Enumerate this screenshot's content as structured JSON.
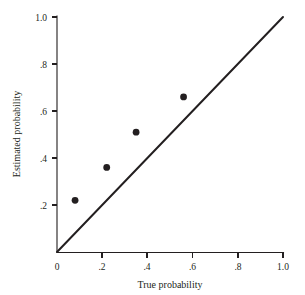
{
  "chart_data": {
    "type": "scatter",
    "title": "",
    "xlabel": "True probability",
    "ylabel": "Estimated probability",
    "xlim": [
      0,
      1.0
    ],
    "ylim": [
      0,
      1.0
    ],
    "grid": false,
    "legend": null,
    "x_ticks": [
      "0",
      ".2",
      ".4",
      ".6",
      ".8",
      "1.0"
    ],
    "x_tick_values": [
      0,
      0.2,
      0.4,
      0.6,
      0.8,
      1.0
    ],
    "y_ticks": [
      ".2",
      ".4",
      ".6",
      ".8",
      "1.0"
    ],
    "y_tick_values": [
      0.2,
      0.4,
      0.6,
      0.8,
      1.0
    ],
    "series": [
      {
        "name": "Estimated vs true probability",
        "marker": "filled-circle",
        "marker_color": "#231f20",
        "points": [
          {
            "x": 0.08,
            "y": 0.22
          },
          {
            "x": 0.22,
            "y": 0.36
          },
          {
            "x": 0.35,
            "y": 0.51
          },
          {
            "x": 0.56,
            "y": 0.66
          }
        ]
      }
    ],
    "reference_line": {
      "name": "identity-line",
      "from": {
        "x": 0.0,
        "y": 0.0
      },
      "to": {
        "x": 1.0,
        "y": 1.0
      },
      "color": "#231f20"
    },
    "colors": {
      "ink": "#231f20",
      "background": "#ffffff"
    }
  }
}
